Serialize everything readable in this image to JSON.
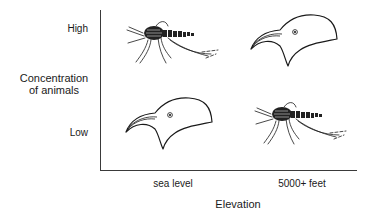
{
  "diagram": {
    "y_axis": {
      "title_line1": "Concentration",
      "title_line2": "of animals",
      "ticks": [
        "High",
        "Low"
      ]
    },
    "x_axis": {
      "title": "Elevation",
      "ticks": [
        "sea level",
        "5000+ feet"
      ]
    },
    "cells": [
      {
        "row": "High",
        "column": "sea level",
        "animal": "mosquito"
      },
      {
        "row": "High",
        "column": "5000+ feet",
        "animal": "bird"
      },
      {
        "row": "Low",
        "column": "sea level",
        "animal": "bird"
      },
      {
        "row": "Low",
        "column": "5000+ feet",
        "animal": "mosquito"
      }
    ],
    "colors": {
      "ink": "#1a1a1a",
      "axis": "#3a3a3a",
      "background": "#ffffff"
    }
  }
}
